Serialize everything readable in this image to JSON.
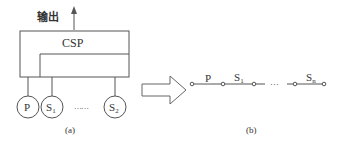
{
  "panel_a": {
    "output_label": "输出",
    "block_label": "CSP",
    "nodes": [
      {
        "main": "P",
        "sub": ""
      },
      {
        "main": "S",
        "sub": "1"
      },
      {
        "main": "S",
        "sub": "2"
      }
    ],
    "ellipsis": "……",
    "caption": "(a)"
  },
  "panel_b": {
    "edges": [
      {
        "main": "P",
        "sub": ""
      },
      {
        "main": "S",
        "sub": "1"
      },
      {
        "main": "S",
        "sub": "n"
      }
    ],
    "ellipsis": "···",
    "caption": "(b)"
  },
  "colors": {
    "stroke": "#555555",
    "text": "#333333"
  }
}
